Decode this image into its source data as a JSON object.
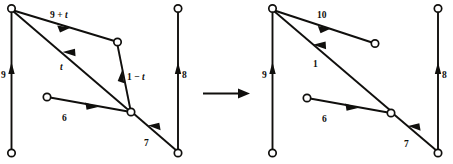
{
  "figure": {
    "title": "",
    "type": "directed-graph-transformation",
    "colors": {
      "ink": "#100f0d",
      "background": "#ffffff",
      "node_fill": "#ffffff"
    },
    "transition": {
      "symbol": "right-arrow",
      "label": ""
    },
    "panels": [
      {
        "id": "left-panel",
        "name": "before-state",
        "labels": {
          "left_vertical": "9",
          "top_diagonal": "9 + t",
          "long_diagonal": "t",
          "short_diagonal": "1 − t",
          "lower_left": "6",
          "lower_right": "7",
          "right_vertical": "8"
        },
        "label_parts": {
          "top_diagonal": {
            "pre": "9 + ",
            "ital": "t"
          },
          "long_diagonal": {
            "pre": "",
            "ital": "t"
          },
          "short_diagonal": {
            "pre": "1 − ",
            "ital": "t"
          }
        }
      },
      {
        "id": "right-panel",
        "name": "after-state",
        "labels": {
          "left_vertical": "9",
          "top_diagonal": "10",
          "long_diagonal": "1",
          "lower_left": "6",
          "lower_right": "7",
          "right_vertical": "8"
        }
      }
    ]
  }
}
